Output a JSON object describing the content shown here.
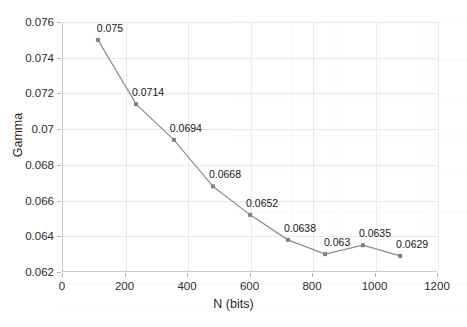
{
  "chart_data": {
    "type": "scatter",
    "title": "",
    "xlabel": "N (bits)",
    "ylabel": "Gamma",
    "xlim": [
      0,
      1200
    ],
    "ylim": [
      0.062,
      0.076
    ],
    "grid": true,
    "legend": "none",
    "x_ticks": [
      0,
      200,
      400,
      600,
      800,
      1000,
      1200
    ],
    "x_tick_labels": [
      "0",
      "200",
      "400",
      "600",
      "800",
      "1000",
      "1200"
    ],
    "y_ticks": [
      0.062,
      0.064,
      0.066,
      0.068,
      0.07,
      0.072,
      0.074,
      0.076
    ],
    "y_tick_labels": [
      "0.062",
      "0.064",
      "0.066",
      "0.068",
      "0.07",
      "0.072",
      "0.074",
      "0.076"
    ],
    "series": [
      {
        "name": "Gamma vs N",
        "marker_color": "#808080",
        "line_color": "#8c8c8c",
        "x": [
          115,
          237,
          358,
          483,
          602,
          723,
          842,
          963,
          1082
        ],
        "y": [
          0.075,
          0.0714,
          0.0694,
          0.0668,
          0.0652,
          0.0638,
          0.063,
          0.0635,
          0.0629
        ],
        "point_labels": [
          "0.075",
          "0.0714",
          "0.0694",
          "0.0668",
          "0.0652",
          "0.0638",
          "0.063",
          "0.0635",
          "0.0629"
        ]
      }
    ]
  },
  "style": {
    "grid_color": "#e9e9e9",
    "axis_color": "#c8c8c8",
    "text_color": "#1f1f1f",
    "background": "#ffffff"
  }
}
